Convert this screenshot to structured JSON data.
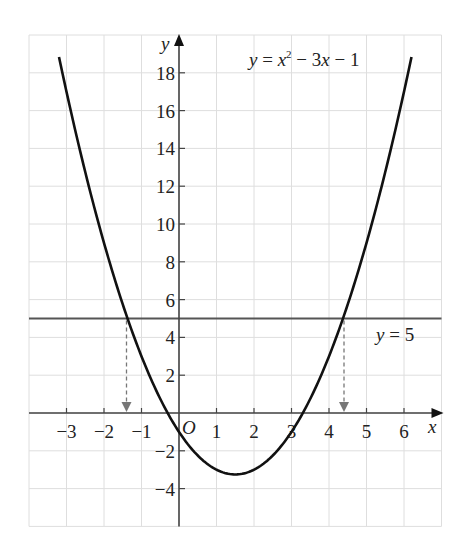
{
  "chart_data": {
    "type": "line",
    "title": "",
    "xlabel": "x",
    "ylabel": "y",
    "xlim": [
      -4,
      7
    ],
    "ylim": [
      -6,
      20
    ],
    "grid": true,
    "x_ticks": [
      -3,
      -2,
      -1,
      1,
      2,
      3,
      4,
      5,
      6
    ],
    "y_ticks": [
      -4,
      -2,
      2,
      4,
      6,
      8,
      10,
      12,
      14,
      16,
      18
    ],
    "origin_label": "O",
    "series": [
      {
        "name": "y = x² − 3x − 1",
        "kind": "curve",
        "function": "x^2 - 3x - 1",
        "x_range": [
          -3.2,
          6.2
        ],
        "vertex": [
          1.5,
          -3.25
        ],
        "label": {
          "prefix": "y = x",
          "sup": "2",
          "suffix": " − 3x − 1"
        }
      },
      {
        "name": "y = 5",
        "kind": "horizontal-line",
        "y": 5,
        "label": {
          "text": "y = 5"
        }
      }
    ],
    "annotations": [
      {
        "type": "dashed-arrow",
        "from": [
          -1.4,
          5
        ],
        "to": [
          -1.4,
          0
        ],
        "note": "intersection x ≈ -1.4"
      },
      {
        "type": "dashed-arrow",
        "from": [
          4.4,
          5
        ],
        "to": [
          4.4,
          0
        ],
        "note": "intersection x ≈ 4.4"
      }
    ]
  },
  "labels": {
    "x_axis": "x",
    "y_axis": "y",
    "origin": "O",
    "curve_eq_y": "y",
    "curve_eq_eq": " = ",
    "curve_eq_x": "x",
    "curve_eq_sup": "2",
    "curve_eq_rest1": " − 3",
    "curve_eq_rest_x": "x",
    "curve_eq_rest2": " − 1",
    "line_eq_y": "y",
    "line_eq_rest": " = 5"
  },
  "colors": {
    "curve": "#111111",
    "axis": "#444444",
    "line": "#555555",
    "grid": "#dedede",
    "dashed": "#777777"
  }
}
